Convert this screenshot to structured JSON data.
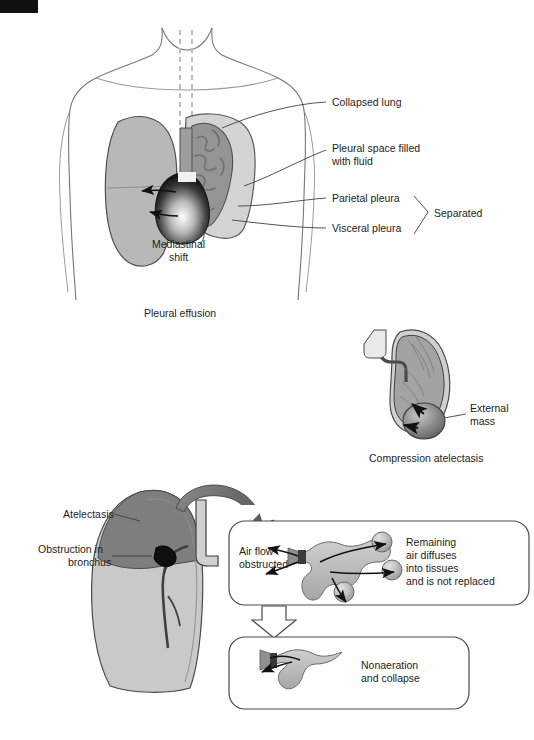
{
  "page": {
    "width": 534,
    "height": 740,
    "background": "#ffffff",
    "corner_mark_color": "#111111"
  },
  "colors": {
    "outline": "#555555",
    "lung_normal_fill": "#b6b6b6",
    "lung_light_fill": "#cacaca",
    "collapsed_lung_fill": "#8f8f8f",
    "pleural_fluid_fill": "#d2d2d2",
    "dark_region_fill": "#7c7c7c",
    "heart_dark": "#2b2b2b",
    "arrow_gray": "#6f6f6f",
    "text": "#1d1d1d"
  },
  "panel_effusion": {
    "caption": "Pleural effusion",
    "labels": {
      "collapsed_lung": "Collapsed lung",
      "pleural_space_line1": "Pleural space filled",
      "pleural_space_line2": "with fluid",
      "parietal_pleura": "Parietal pleura",
      "visceral_pleura": "Visceral pleura",
      "separated": "Separated",
      "mediastinal_line1": "Mediastinal",
      "mediastinal_line2": "shift"
    }
  },
  "panel_compression": {
    "caption": "Compression atelectasis",
    "labels": {
      "external_mass_line1": "External",
      "external_mass_line2": "mass"
    }
  },
  "panel_obstruction": {
    "labels": {
      "atelectasis": "Atelectasis",
      "obstruction_line1": "Obstruction in",
      "obstruction_line2": "bronchus"
    },
    "box_top": {
      "left_line1": "Air flow",
      "left_line2": "obstructed",
      "right_line1": "Remaining",
      "right_line2": "air diffuses",
      "right_line3": "into tissues",
      "right_line4": "and is not replaced"
    },
    "box_bottom": {
      "text_line1": "Nonaeration",
      "text_line2": "and collapse"
    }
  }
}
